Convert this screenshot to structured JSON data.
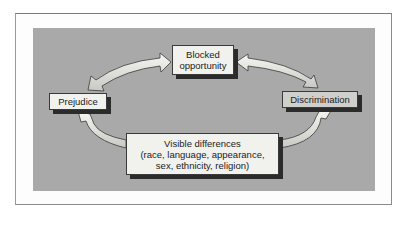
{
  "diagram": {
    "type": "cycle",
    "nodes": {
      "blocked_opportunity": {
        "line1": "Blocked",
        "line2": "opportunity"
      },
      "prejudice": {
        "label": "Prejudice"
      },
      "discrimination": {
        "label": "Discrimination"
      },
      "visible_differences": {
        "line1": "Visible differences",
        "line2": "(race, language, appearance,",
        "line3": "sex, ethnicity, religion)"
      }
    },
    "edges": [
      {
        "from": "Prejudice",
        "to": "Blocked opportunity",
        "direction": "bidirectional"
      },
      {
        "from": "Blocked opportunity",
        "to": "Discrimination",
        "direction": "bidirectional"
      },
      {
        "from": "Visible differences",
        "to": "Prejudice",
        "direction": "one-way"
      },
      {
        "from": "Visible differences",
        "to": "Discrimination",
        "direction": "one-way"
      }
    ],
    "colors": {
      "panel": "#a9a9a9",
      "box_fill": "#f1f1ee",
      "discrimination_fill": "#cfcfcc",
      "shadow": "#2b2b2b",
      "arrow_fill": "#ecece6"
    }
  }
}
